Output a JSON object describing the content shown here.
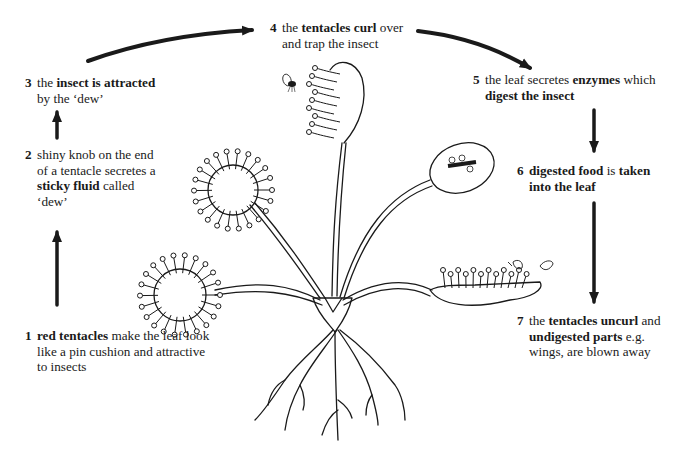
{
  "diagram": {
    "steps": [
      {
        "num": "1",
        "parts": [
          {
            "t": "red tentacles",
            "b": true
          },
          {
            "t": " make the leaf look like a pin cushion and attractive to insects",
            "b": false
          }
        ]
      },
      {
        "num": "2",
        "parts": [
          {
            "t": "shiny knob on the end of a tentacle secretes a ",
            "b": false
          },
          {
            "t": "sticky fluid",
            "b": true
          },
          {
            "t": " called ‘dew’",
            "b": false
          }
        ]
      },
      {
        "num": "3",
        "parts": [
          {
            "t": "the ",
            "b": false
          },
          {
            "t": "insect is attracted",
            "b": true
          },
          {
            "t": " by the ‘dew’",
            "b": false
          }
        ]
      },
      {
        "num": "4",
        "parts": [
          {
            "t": "the ",
            "b": false
          },
          {
            "t": "tentacles curl",
            "b": true
          },
          {
            "t": " over and trap the insect",
            "b": false
          }
        ]
      },
      {
        "num": "5",
        "parts": [
          {
            "t": "the leaf secretes ",
            "b": false
          },
          {
            "t": "enzymes",
            "b": true
          },
          {
            "t": " which ",
            "b": false
          },
          {
            "t": "digest the insect",
            "b": true
          }
        ]
      },
      {
        "num": "6",
        "parts": [
          {
            "t": "digested food",
            "b": true
          },
          {
            "t": " is ",
            "b": false
          },
          {
            "t": "taken into the leaf",
            "b": true
          }
        ]
      },
      {
        "num": "7",
        "parts": [
          {
            "t": "the ",
            "b": false
          },
          {
            "t": "tentacles uncurl",
            "b": true
          },
          {
            "t": " and ",
            "b": false
          },
          {
            "t": "undigested parts",
            "b": true
          },
          {
            "t": " e.g. wings, are blown away",
            "b": false
          }
        ]
      }
    ],
    "arrows": [
      {
        "from": "1",
        "to": "2",
        "direction": "up"
      },
      {
        "from": "2",
        "to": "3",
        "direction": "up"
      },
      {
        "from": "3",
        "to": "4",
        "direction": "curved-right"
      },
      {
        "from": "4",
        "to": "5",
        "direction": "curved-right-down"
      },
      {
        "from": "5",
        "to": "6",
        "direction": "down"
      },
      {
        "from": "6",
        "to": "7",
        "direction": "down"
      }
    ],
    "illustrations": [
      "sundew-plant",
      "fly",
      "insect-wings"
    ],
    "colors": {
      "ink": "#1a1a1a",
      "background": "#ffffff"
    }
  }
}
